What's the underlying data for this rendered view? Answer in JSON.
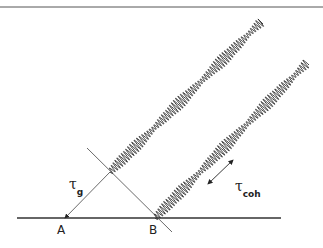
{
  "diagram": {
    "points": {
      "A": "A",
      "B": "B"
    },
    "labels": {
      "tau_symbol": "τ",
      "geometric_delay_sub": "g",
      "coherence_time_sub": "coh"
    },
    "elements": {
      "baseline": {
        "x1": 17,
        "y1": 218,
        "x2": 281,
        "y2": 218
      },
      "wavefront": {
        "x1": 87,
        "y1": 148,
        "x2": 172,
        "y2": 232
      },
      "delay_arrow": {
        "x1": 110,
        "y1": 172,
        "x2": 65,
        "y2": 218
      },
      "coherence_arrow": {
        "x1": 208,
        "y1": 184,
        "x2": 233,
        "y2": 160
      },
      "upper_wave": {
        "x1": 110,
        "y1": 172,
        "x2": 261,
        "y2": 22
      },
      "lower_wave": {
        "x1": 155,
        "y1": 218,
        "x2": 307,
        "y2": 63
      },
      "header_rule": {
        "x1": 0,
        "y1": 7,
        "x2": 323,
        "y2": 7
      }
    },
    "colors": {
      "line": "#333333",
      "wave": "#2a2a2a",
      "background": "#ffffff"
    }
  }
}
